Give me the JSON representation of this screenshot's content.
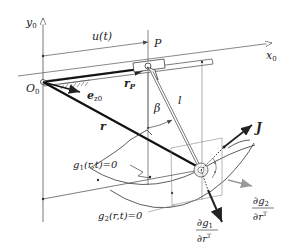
{
  "diagram": {
    "axes": {
      "y_axis": "y",
      "y_axis_sub": "0",
      "x_axis": "x",
      "x_axis_sub": "0",
      "origin": "O",
      "origin_sub": "0"
    },
    "labels": {
      "displacement": "u(t)",
      "point_p": "P",
      "position_p": "r",
      "position_p_sub": "P",
      "unit_vector": "e",
      "unit_vector_sub": "z0",
      "position": "r",
      "angle": "β",
      "length": "l",
      "force": "J",
      "constraint1": "g",
      "constraint1_sub": "1",
      "constraint1_args": "(r,t)=0",
      "constraint2": "g",
      "constraint2_sub": "2",
      "constraint2_args": "(r,t)=0",
      "grad1_num": "∂g",
      "grad1_num_sub": "1",
      "grad1_den": "∂r",
      "grad1_den_sup": "T",
      "grad2_num": "∂g",
      "grad2_num_sub": "2",
      "grad2_den": "∂r",
      "grad2_den_sup": "T"
    }
  }
}
